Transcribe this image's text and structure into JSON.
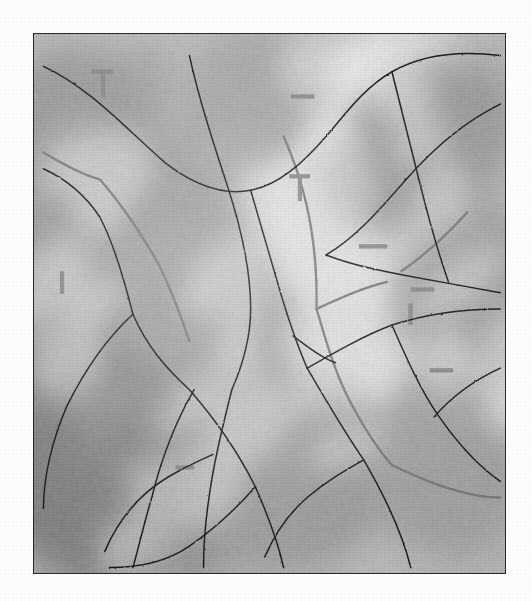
{
  "document": {
    "type": "scanned-topographic-map",
    "title": "Shaded relief map sheet",
    "rendering": "grayscale halftone scan",
    "page_background": "#fdfdfc"
  },
  "frame": {
    "label": "map neatline border",
    "x": 33,
    "y": 33,
    "width": 473,
    "height": 541,
    "border_color": "#2a2a2a",
    "border_width_px": 1.6
  },
  "palette": {
    "paper": "#fdfdfc",
    "terrain_base": "#bdbdbd",
    "terrain_light": "#ededed",
    "terrain_mid": "#b4b4b4",
    "terrain_shadow": "#8a8a8a",
    "terrain_deep_shadow": "#6f6f6f",
    "drainage_line": "#1f1f1f",
    "boundary_dotted": "#7b7b7b",
    "tick_mark": "#8a8a8a",
    "neatline": "#2a2a2a"
  },
  "map_content": {
    "relief": {
      "style": "hillshade",
      "illumination": "northwest",
      "band_orientation": "northeast-southwest diagonal ridges",
      "shadow_bands": [
        {
          "name": "west-flank-shadow",
          "cx": 16,
          "cy": 62,
          "rx": 26,
          "ry": 46,
          "rot": -32,
          "tone": "#8d8d8d"
        },
        {
          "name": "upper-west-shadow",
          "cx": 11,
          "cy": 22,
          "rx": 18,
          "ry": 20,
          "rot": -28,
          "tone": "#9a9a9a"
        },
        {
          "name": "central-valley-shadow",
          "cx": 30,
          "cy": 48,
          "rx": 20,
          "ry": 38,
          "rot": -34,
          "tone": "#9e9e9e"
        },
        {
          "name": "southwest-deep-shadow",
          "cx": 13,
          "cy": 80,
          "rx": 22,
          "ry": 24,
          "rot": -30,
          "tone": "#7f7f7f"
        },
        {
          "name": "northeast-ridge-shadow",
          "cx": 82,
          "cy": 21,
          "rx": 22,
          "ry": 15,
          "rot": -30,
          "tone": "#9b9b9b"
        },
        {
          "name": "east-slope-shadow",
          "cx": 92,
          "cy": 47,
          "rx": 16,
          "ry": 20,
          "rot": -26,
          "tone": "#a0a0a0"
        },
        {
          "name": "south-central-shadow",
          "cx": 55,
          "cy": 82,
          "rx": 22,
          "ry": 18,
          "rot": -24,
          "tone": "#9c9c9c"
        },
        {
          "name": "southeast-shadow",
          "cx": 88,
          "cy": 80,
          "rx": 16,
          "ry": 18,
          "rot": -28,
          "tone": "#a2a2a2"
        },
        {
          "name": "north-central-shadow",
          "cx": 46,
          "cy": 12,
          "rx": 17,
          "ry": 11,
          "rot": -20,
          "tone": "#a6a6a6"
        }
      ],
      "highlight_bands": [
        {
          "name": "west-ridge-highlight",
          "cx": 8,
          "cy": 42,
          "rx": 13,
          "ry": 26,
          "rot": -32,
          "tone": "#ececec"
        },
        {
          "name": "central-ridge-highlight",
          "cx": 38,
          "cy": 62,
          "rx": 14,
          "ry": 30,
          "rot": -34,
          "tone": "#e8e8e8"
        },
        {
          "name": "northeast-highlight",
          "cx": 72,
          "cy": 12,
          "rx": 20,
          "ry": 12,
          "rot": -26,
          "tone": "#eeeeee"
        },
        {
          "name": "east-highlight",
          "cx": 78,
          "cy": 38,
          "rx": 17,
          "ry": 14,
          "rot": -28,
          "tone": "#e6e6e6"
        },
        {
          "name": "mid-highlight",
          "cx": 58,
          "cy": 35,
          "rx": 14,
          "ry": 16,
          "rot": -30,
          "tone": "#e4e4e4"
        },
        {
          "name": "south-highlight",
          "cx": 67,
          "cy": 66,
          "rx": 14,
          "ry": 16,
          "rot": -28,
          "tone": "#e2e2e2"
        },
        {
          "name": "southwest-highlight",
          "cx": 30,
          "cy": 90,
          "rx": 16,
          "ry": 12,
          "rot": -26,
          "tone": "#e4e4e4"
        },
        {
          "name": "southeast-highlight",
          "cx": 95,
          "cy": 62,
          "rx": 12,
          "ry": 14,
          "rot": -30,
          "tone": "#e9e9e9"
        }
      ]
    },
    "drainage_network": {
      "label": "stream and river channels",
      "line_color": "#1f1f1f",
      "line_width_px": 1.5,
      "features": [
        {
          "name": "northwest-headwater",
          "path": "M 2 6 C 12 10, 20 18, 28 24 C 34 28, 40 30, 46 29"
        },
        {
          "name": "north-rim-channel",
          "path": "M 46 29 C 52 28, 57 24, 62 19 C 66 15, 70 10, 76 7 C 82 4, 90 3, 99 4"
        },
        {
          "name": "west-tributary",
          "path": "M 2 25 C 7 27, 11 30, 14 34 C 17 39, 19 45, 21 52"
        },
        {
          "name": "central-main-stem",
          "path": "M 21 52 C 24 58, 28 62, 33 66 C 38 71, 43 77, 47 84 C 50 90, 52 95, 53 99"
        },
        {
          "name": "north-central-creek",
          "path": "M 33 4 C 35 12, 38 20, 41 28 C 44 36, 46 44, 46 51 C 46 57, 44 62, 42 66"
        },
        {
          "name": "upper-junction-branch",
          "path": "M 46 29 C 48 35, 50 41, 52 47 C 54 53, 56 58, 58 62"
        },
        {
          "name": "east-ridge-stream",
          "path": "M 76 7 C 78 14, 80 21, 82 28 C 84 35, 86 41, 88 46"
        },
        {
          "name": "northeast-arc",
          "path": "M 99 13 C 92 16, 85 21, 79 27 C 73 33, 68 38, 62 41"
        },
        {
          "name": "east-confluence",
          "path": "M 62 41 C 68 43, 74 44, 80 45 C 86 46, 93 47, 99 48"
        },
        {
          "name": "mid-east-link",
          "path": "M 58 62 C 64 59, 70 56, 76 54 C 83 52, 90 51, 99 51"
        },
        {
          "name": "southeast-channel",
          "path": "M 76 54 C 79 60, 82 66, 86 71 C 90 76, 94 80, 99 83"
        },
        {
          "name": "south-east-creek",
          "path": "M 58 62 C 62 68, 66 74, 70 79 C 74 85, 78 92, 80 99"
        },
        {
          "name": "southwest-diagonal",
          "path": "M 47 84 C 43 88, 38 92, 33 95 C 28 98, 22 99, 16 99"
        },
        {
          "name": "south-central-branch",
          "path": "M 34 66 C 30 72, 27 79, 25 86 C 23 92, 22 96, 21 99"
        },
        {
          "name": "lower-west-feeder",
          "path": "M 21 52 C 16 56, 11 62, 7 69 C 4 75, 2 82, 2 88"
        },
        {
          "name": "lower-mid-tributary",
          "path": "M 42 66 C 40 73, 38 80, 37 87 C 36 93, 36 97, 36 99"
        },
        {
          "name": "south-branch-west",
          "path": "M 38 78 C 33 80, 28 82, 24 85 C 20 88, 17 92, 15 96"
        },
        {
          "name": "low-east-tributary",
          "path": "M 70 79 C 66 81, 62 83, 58 86 C 54 89, 51 93, 49 97"
        },
        {
          "name": "east-edge-feeder",
          "path": "M 99 62 C 94 64, 89 67, 85 71"
        },
        {
          "name": "mid-short-spur",
          "path": "M 55 56 C 58 58, 61 60, 64 61"
        }
      ]
    },
    "boundary_lines": {
      "label": "dotted administrative boundary",
      "color": "#7b7b7b",
      "style": "dotted",
      "dash_pattern": "2 3",
      "line_width_px": 2.4,
      "features": [
        {
          "name": "northwest-boundary-segment",
          "path": "M 2 22 C 6 24, 10 26, 14 27"
        },
        {
          "name": "west-boundary-descent",
          "path": "M 14 27 C 18 31, 22 36, 26 42 C 29 47, 31 52, 33 57"
        },
        {
          "name": "north-boundary-run",
          "path": "M 53 19 C 56 25, 58 31, 59 37 C 60 43, 60 47, 60 51"
        },
        {
          "name": "central-boundary-descent",
          "path": "M 60 51 C 62 57, 64 63, 67 68 C 70 73, 73 77, 76 80"
        },
        {
          "name": "southeast-boundary",
          "path": "M 76 80 C 81 82, 86 84, 91 85 C 95 86, 98 86, 99 86"
        },
        {
          "name": "upper-east-boundary",
          "path": "M 60 51 C 65 49, 70 47, 75 46"
        },
        {
          "name": "east-boundary-tail",
          "path": "M 78 44 C 83 41, 88 37, 92 33"
        }
      ]
    },
    "tick_marks": {
      "label": "graticule tick marks",
      "color": "#8a8a8a",
      "items": [
        {
          "name": "tick-vertical-nw",
          "x": 14.2,
          "y": 6.6,
          "w": 0.9,
          "h": 5.2
        },
        {
          "name": "tick-horizontal-nw",
          "x": 12.2,
          "y": 6.6,
          "w": 4.6,
          "h": 0.8
        },
        {
          "name": "tick-vertical-north-central",
          "x": 56.0,
          "y": 26.0,
          "w": 0.9,
          "h": 5.0
        },
        {
          "name": "tick-horizontal-north-central",
          "x": 54.2,
          "y": 26.0,
          "w": 4.4,
          "h": 0.8
        },
        {
          "name": "tick-horizontal-north-east",
          "x": 54.5,
          "y": 11.2,
          "w": 5.0,
          "h": 0.8
        },
        {
          "name": "tick-horizontal-mid-east",
          "x": 69.0,
          "y": 39.0,
          "w": 6.0,
          "h": 0.8
        },
        {
          "name": "tick-horizontal-east",
          "x": 80.0,
          "y": 47.0,
          "w": 5.0,
          "h": 0.8
        },
        {
          "name": "tick-vertical-east",
          "x": 79.5,
          "y": 50.0,
          "w": 0.9,
          "h": 4.0
        },
        {
          "name": "tick-horizontal-southeast",
          "x": 84.0,
          "y": 62.0,
          "w": 5.0,
          "h": 0.8
        },
        {
          "name": "tick-vertical-west-lower",
          "x": 5.5,
          "y": 44.0,
          "w": 0.9,
          "h": 4.2
        },
        {
          "name": "tick-horizontal-south-mid",
          "x": 30.0,
          "y": 80.0,
          "w": 4.0,
          "h": 0.8
        }
      ]
    }
  }
}
